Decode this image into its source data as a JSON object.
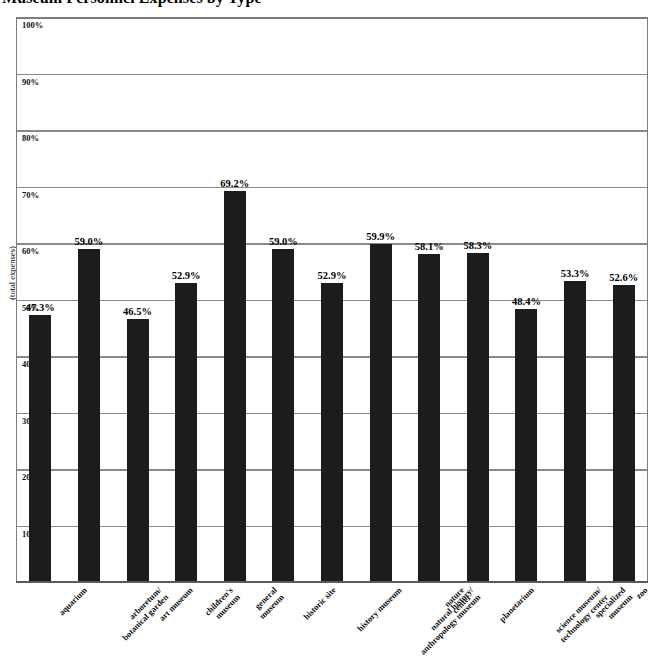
{
  "chart_data": {
    "type": "bar",
    "title": "Museum Personnel Expenses by Type",
    "xlabel": "",
    "ylabel": "(total expenses)",
    "ylim": [
      0,
      100
    ],
    "grid": true,
    "legend": "none",
    "y_ticks": [
      "10%",
      "20%",
      "30%",
      "40%",
      "50%",
      "60%",
      "70%",
      "80%",
      "90%",
      "100%"
    ],
    "y_tick_values": [
      10,
      20,
      30,
      40,
      50,
      60,
      70,
      80,
      90,
      100
    ],
    "categories": [
      "aquarium",
      "arboretum/\nbotanical garden",
      "art museum",
      "children's\nmuseum",
      "general\nmuseum",
      "historic site",
      "history museum",
      "natural history/\nanthropology museum",
      "nature\ncenter",
      "planetarium",
      "science museum/\ntechnology center",
      "specialized\nmuseum",
      "zoo"
    ],
    "values": [
      47.3,
      59.0,
      46.5,
      52.9,
      69.2,
      59.0,
      52.9,
      59.9,
      58.1,
      58.3,
      48.4,
      53.3,
      52.6
    ],
    "value_labels": [
      "47.3%",
      "59.0%",
      "46.5%",
      "52.9%",
      "69.2%",
      "59.0%",
      "52.9%",
      "59.9%",
      "58.1%",
      "58.3%",
      "48.4%",
      "53.3%",
      "52.6%"
    ],
    "bar_color": "#1c1c1c",
    "grid_color": "#8a8a8a",
    "frame_color": "#7d7d7d",
    "background_color": "#ffffff"
  }
}
